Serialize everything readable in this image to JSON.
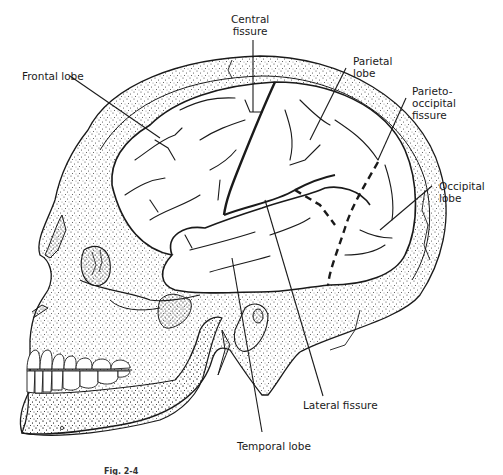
{
  "figure": {
    "type": "anatomical-illustration",
    "colors": {
      "ink": "#1a1a1a",
      "stipple": "#333333",
      "background": "#ffffff"
    }
  },
  "labels": {
    "central_fissure": "Central\nfissure",
    "frontal_lobe": "Frontal lobe",
    "parietal_lobe": "Parietal\nlobe",
    "parieto_occipital_fissure": "Parieto-\noccipital\nfissure",
    "occipital_lobe": "Occipital\nlobe",
    "lateral_fissure": "Lateral fissure",
    "temporal_lobe": "Temporal lobe"
  },
  "caption": {
    "figure_number": "Fig. 2-4",
    "text": "Cerebral hemisphere, lateral view (text truncated at image edge)"
  }
}
